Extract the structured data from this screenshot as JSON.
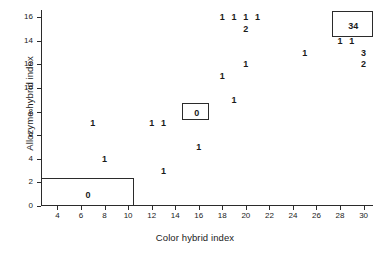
{
  "chart_data": {
    "type": "scatter",
    "title": "",
    "xlabel": "Color hybrid index",
    "ylabel": "Allozyme hybrid index",
    "xlim": [
      2.6,
      30.8
    ],
    "ylim": [
      0,
      16.6
    ],
    "xticks": [
      4,
      6,
      8,
      10,
      12,
      14,
      16,
      18,
      20,
      22,
      24,
      26,
      28,
      30
    ],
    "yticks": [
      0,
      2,
      4,
      6,
      8,
      10,
      12,
      14,
      16
    ],
    "grid": false,
    "legend": null,
    "note": "Each plotted text glyph is a count of individuals at that coordinate.",
    "points": [
      {
        "x": 7,
        "y": 7,
        "label": "1"
      },
      {
        "x": 8,
        "y": 4,
        "label": "1"
      },
      {
        "x": 12,
        "y": 7,
        "label": "1"
      },
      {
        "x": 13,
        "y": 7,
        "label": "1"
      },
      {
        "x": 13,
        "y": 3,
        "label": "1"
      },
      {
        "x": 16,
        "y": 5,
        "label": "1"
      },
      {
        "x": 18,
        "y": 16,
        "label": "1"
      },
      {
        "x": 19,
        "y": 16,
        "label": "1"
      },
      {
        "x": 20,
        "y": 16,
        "label": "1"
      },
      {
        "x": 21,
        "y": 16,
        "label": "1"
      },
      {
        "x": 20,
        "y": 15,
        "label": "2"
      },
      {
        "x": 20,
        "y": 12,
        "label": "1"
      },
      {
        "x": 18,
        "y": 11,
        "label": "1"
      },
      {
        "x": 19,
        "y": 9,
        "label": "1"
      },
      {
        "x": 25,
        "y": 13,
        "label": "1"
      },
      {
        "x": 28,
        "y": 14,
        "label": "1"
      },
      {
        "x": 29,
        "y": 14,
        "label": "1"
      },
      {
        "x": 30,
        "y": 13,
        "label": "3"
      },
      {
        "x": 30,
        "y": 12,
        "label": "2"
      }
    ],
    "boxes": [
      {
        "name": "parental-color-box",
        "label": "0",
        "x0": 2.6,
        "x1": 10.5,
        "y0": 0,
        "y1": 2.4,
        "label_x": 6.5,
        "label_y": 1.0
      },
      {
        "name": "midpoint-box",
        "label": "0",
        "x0": 14.6,
        "x1": 16.9,
        "y0": 7.3,
        "y1": 8.7,
        "label_x": 15.75,
        "label_y": 8.0
      },
      {
        "name": "parental-allozyme-box",
        "label": "34",
        "x0": 27.3,
        "x1": 30.8,
        "y0": 14.3,
        "y1": 16.5,
        "label_x": 29.05,
        "label_y": 15.35
      }
    ]
  },
  "colors": {
    "axis": "#2b2b2b",
    "text": "#1a1a1a",
    "background": "#ffffff"
  }
}
